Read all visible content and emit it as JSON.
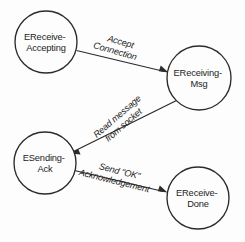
{
  "diagram": {
    "background_color": "#fdfdfd",
    "stroke_color": "#2b2b2b",
    "text_color": "#1c1c1c",
    "nodes": [
      {
        "id": "ereceive-accepting",
        "line1": "EReceive-",
        "line2": "Accepting",
        "cx": 46,
        "cy": 42,
        "r": 31
      },
      {
        "id": "ereceiving-msg",
        "line1": "EReceiving-",
        "line2": "Msg",
        "cx": 199,
        "cy": 78,
        "r": 32
      },
      {
        "id": "esending-ack",
        "line1": "ESending-",
        "line2": "Ack",
        "cx": 45,
        "cy": 163,
        "r": 31
      },
      {
        "id": "ereceive-done",
        "line1": "EReceive-",
        "line2": "Done",
        "cx": 198,
        "cy": 198,
        "r": 31
      }
    ],
    "edges": [
      {
        "id": "accept-connection",
        "from": "ereceive-accepting",
        "to": "ereceiving-msg",
        "line1": "Accept",
        "line2": "Connection",
        "label_x": 121,
        "label_y": 45,
        "rotation": 16
      },
      {
        "id": "read-message",
        "from": "ereceiving-msg",
        "to": "esending-ack",
        "line1": "Read message",
        "line2": "from socket",
        "label_x": 120,
        "label_y": 118,
        "rotation": -41
      },
      {
        "id": "send-ok-ack",
        "from": "esending-ack",
        "to": "ereceive-done",
        "line1": "Send \"OK\"",
        "line2": "Acknowledgement",
        "label_x": 118,
        "label_y": 174,
        "rotation": 14
      }
    ]
  }
}
